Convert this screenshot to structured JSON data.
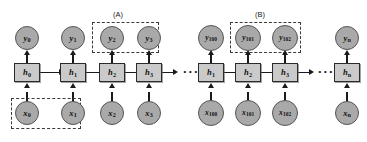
{
  "diagram": {
    "colors": {
      "node_fill": "#a9a9a9",
      "node_stroke": "#555555",
      "state_fill": "#cacaca",
      "state_stroke": "#2b2b2b",
      "connector": "#1a1a1a",
      "dashed_group": "#3a3a3a",
      "background": "#ffffff"
    },
    "group_labels": [
      {
        "id": "group-label-a",
        "text": "(A)"
      },
      {
        "id": "group-label-b",
        "text": "(B)"
      }
    ],
    "ellipses": [
      {
        "id": "ellipsis-middle",
        "text": "···"
      },
      {
        "id": "ellipsis-right",
        "text": "···"
      }
    ],
    "columns": [
      {
        "id": "t0",
        "output": {
          "label": "y",
          "sub": "0"
        },
        "state": {
          "label": "h",
          "sub": "0"
        },
        "input": {
          "label": "x",
          "sub": "0"
        }
      },
      {
        "id": "t1",
        "output": {
          "label": "y",
          "sub": "1"
        },
        "state": {
          "label": "h",
          "sub": "1"
        },
        "input": {
          "label": "x",
          "sub": "1"
        }
      },
      {
        "id": "t2",
        "output": {
          "label": "y",
          "sub": "2"
        },
        "state": {
          "label": "h",
          "sub": "2"
        },
        "input": {
          "label": "x",
          "sub": "2"
        }
      },
      {
        "id": "t3",
        "output": {
          "label": "y",
          "sub": "3"
        },
        "state": {
          "label": "h",
          "sub": "3"
        },
        "input": {
          "label": "x",
          "sub": "3"
        }
      },
      {
        "id": "t100",
        "output": {
          "label": "y",
          "sub": "100"
        },
        "state": {
          "label": "h",
          "sub": "1"
        },
        "input": {
          "label": "x",
          "sub": "100"
        }
      },
      {
        "id": "t101",
        "output": {
          "label": "y",
          "sub": "101"
        },
        "state": {
          "label": "h",
          "sub": "2"
        },
        "input": {
          "label": "x",
          "sub": "101"
        }
      },
      {
        "id": "t102",
        "output": {
          "label": "y",
          "sub": "102"
        },
        "state": {
          "label": "h",
          "sub": "3"
        },
        "input": {
          "label": "x",
          "sub": "102"
        }
      },
      {
        "id": "tn",
        "output": {
          "label": "y",
          "sub": "n"
        },
        "state": {
          "label": "h",
          "sub": "n"
        },
        "input": {
          "label": "x",
          "sub": "n"
        }
      }
    ]
  }
}
